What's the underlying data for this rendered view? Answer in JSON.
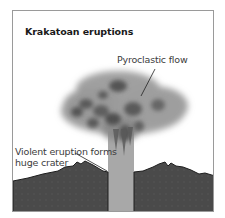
{
  "diagram": {
    "title": "Krakatoan eruptions",
    "labels": {
      "pyroclastic_flow": "Pyroclastic flow",
      "crater_line1": "Violent eruption forms",
      "crater_line2": "huge crater"
    },
    "colors": {
      "frame_border": "#9a9a9a",
      "ground": "#4a4a4a",
      "ground_outline": "#1e1e1e",
      "column": "#a8a8a8",
      "cloud_light": "#9c9c9c",
      "cloud_dark": "#5a5a5a",
      "text": "#3c3c3c"
    }
  }
}
